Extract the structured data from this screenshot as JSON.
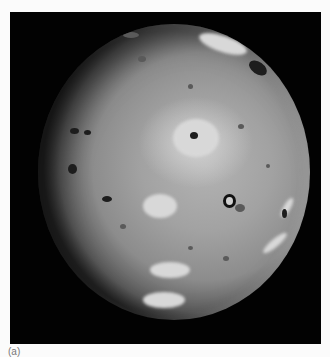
{
  "figure": {
    "caption_label": "(a)",
    "colors": {
      "page_background": "#fbfbfb",
      "frame_background": "#020202",
      "surface_mid_gray": "#a2a2a2",
      "surface_highlight": "#e1e1e1",
      "dark_features": "#1d1d1d"
    }
  }
}
